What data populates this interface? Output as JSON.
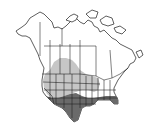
{
  "map": {
    "type": "species-range-map",
    "region": "North America",
    "legend_colors": {
      "breeding_range": "#c6c6c6",
      "year_round_range": "#6a6a6a",
      "outline": "#1a1a1a",
      "background": "#ffffff"
    },
    "regions": [
      {
        "name": "breeding-range",
        "color": "#c6c6c6",
        "area": "western US and south-central Canada"
      },
      {
        "name": "year-round-range",
        "color": "#6a6a6a",
        "area": "southern US from California to Florida"
      }
    ]
  }
}
